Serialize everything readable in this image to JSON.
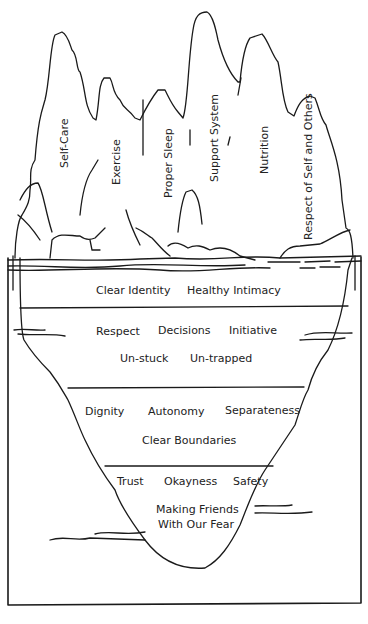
{
  "diagram": {
    "type": "iceberg",
    "above_water": {
      "peaks": [
        {
          "label": "Self-Care"
        },
        {
          "label": "Exercise"
        },
        {
          "label": "Proper Sleep"
        },
        {
          "label": "Support System"
        },
        {
          "label": "Nutrition"
        },
        {
          "label": "Respect of Self and Others"
        }
      ]
    },
    "below_water": {
      "layers": [
        {
          "items": [
            "Clear Identity",
            "Healthy Intimacy"
          ]
        },
        {
          "items": [
            "Respect",
            "Decisions",
            "Initiative",
            "Un-stuck",
            "Un-trapped"
          ]
        },
        {
          "items": [
            "Dignity",
            "Autonomy",
            "Separateness",
            "Clear Boundaries"
          ]
        },
        {
          "items": [
            "Trust",
            "Okayness",
            "Safety",
            "Making Friends",
            "With Our Fear"
          ]
        }
      ]
    },
    "colors": {
      "line": "#1a1a1a",
      "background": "#ffffff"
    }
  }
}
